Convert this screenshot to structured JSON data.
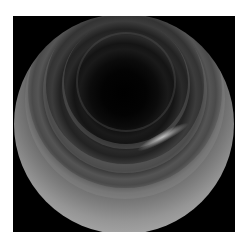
{
  "image": {
    "type": "endoscopic-view",
    "description": "Grayscale circular endoscopic view of a tubular lumen with concentric ring folds and a dark center",
    "colors": {
      "background": "#ffffff",
      "frame": "#000000",
      "lumen_center": "#000000",
      "wall_light": "#b0b0b0",
      "highlight": "#ebebeb"
    }
  }
}
